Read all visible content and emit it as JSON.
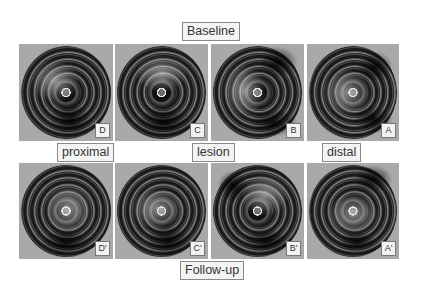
{
  "labels": {
    "baseline": "Baseline",
    "followup": "Follow-up",
    "proximal": "proximal",
    "lesion": "lesion",
    "distal": "distal"
  },
  "rows": [
    {
      "name": "baseline",
      "panels": [
        {
          "tag": "D"
        },
        {
          "tag": "C"
        },
        {
          "tag": "B"
        },
        {
          "tag": "A"
        }
      ]
    },
    {
      "name": "follow-up",
      "panels": [
        {
          "tag": "D'"
        },
        {
          "tag": "C'"
        },
        {
          "tag": "B'"
        },
        {
          "tag": "A'"
        }
      ]
    }
  ],
  "colors": {
    "panel_bg": "#a9a9a9",
    "label_border": "#8a8a8a",
    "label_bg": "#f4f4f4"
  }
}
